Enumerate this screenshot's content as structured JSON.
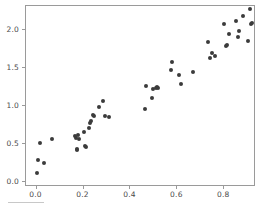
{
  "chart_data": {
    "type": "scatter",
    "title": "",
    "xlabel": "",
    "ylabel": "",
    "xlim": [
      -0.045,
      0.935
    ],
    "ylim": [
      -0.066,
      2.316
    ],
    "grid": false,
    "legend": null,
    "xticks": [
      0.0,
      0.2,
      0.4,
      0.6,
      0.8
    ],
    "yticks": [
      0.0,
      0.5,
      1.0,
      1.5,
      2.0
    ],
    "xticklabels": [
      "0.0",
      "0.2",
      "0.4",
      "0.6",
      "0.8"
    ],
    "yticklabels": [
      "0.0",
      "0.5",
      "1.0",
      "1.5",
      "2.0"
    ],
    "marker": "circle",
    "marker_color": "#3b3b3b",
    "marker_size": 4,
    "n_points": 64,
    "series": [
      {
        "name": "data",
        "points": [
          [
            0.008,
            0.11
          ],
          [
            0.011,
            0.28
          ],
          [
            0.02,
            0.5
          ],
          [
            0.036,
            0.24
          ],
          [
            0.068,
            0.55
          ],
          [
            0.166,
            0.59
          ],
          [
            0.172,
            0.57
          ],
          [
            0.175,
            0.42
          ],
          [
            0.178,
            0.41
          ],
          [
            0.18,
            0.6
          ],
          [
            0.183,
            0.55
          ],
          [
            0.208,
            0.64
          ],
          [
            0.212,
            0.46
          ],
          [
            0.217,
            0.45
          ],
          [
            0.228,
            0.7
          ],
          [
            0.234,
            0.76
          ],
          [
            0.238,
            0.79
          ],
          [
            0.243,
            0.87
          ],
          [
            0.251,
            0.86
          ],
          [
            0.272,
            0.97
          ],
          [
            0.289,
            1.05
          ],
          [
            0.296,
            0.85
          ],
          [
            0.312,
            0.84
          ],
          [
            0.466,
            0.95
          ],
          [
            0.47,
            1.25
          ],
          [
            0.497,
            1.09
          ],
          [
            0.502,
            1.21
          ],
          [
            0.512,
            1.23
          ],
          [
            0.519,
            1.24
          ],
          [
            0.523,
            1.22
          ],
          [
            0.576,
            1.46
          ],
          [
            0.581,
            1.56
          ],
          [
            0.613,
            1.4
          ],
          [
            0.621,
            1.27
          ],
          [
            0.672,
            1.43
          ],
          [
            0.735,
            1.83
          ],
          [
            0.742,
            1.62
          ],
          [
            0.751,
            1.68
          ],
          [
            0.766,
            1.64
          ],
          [
            0.804,
            2.07
          ],
          [
            0.812,
            1.77
          ],
          [
            0.815,
            1.79
          ],
          [
            0.826,
            1.94
          ],
          [
            0.855,
            2.11
          ],
          [
            0.862,
            1.89
          ],
          [
            0.866,
            1.98
          ],
          [
            0.885,
            2.17
          ],
          [
            0.905,
            1.84
          ],
          [
            0.915,
            2.27
          ],
          [
            0.918,
            2.06
          ],
          [
            0.922,
            2.08
          ]
        ]
      }
    ]
  },
  "axes": {
    "frame_color": "#9a9a9a",
    "tick_color": "#9a9a9a",
    "label_color": "#4a4a4a",
    "background": "#ffffff"
  },
  "artifact": {
    "caption_fragment": ""
  }
}
